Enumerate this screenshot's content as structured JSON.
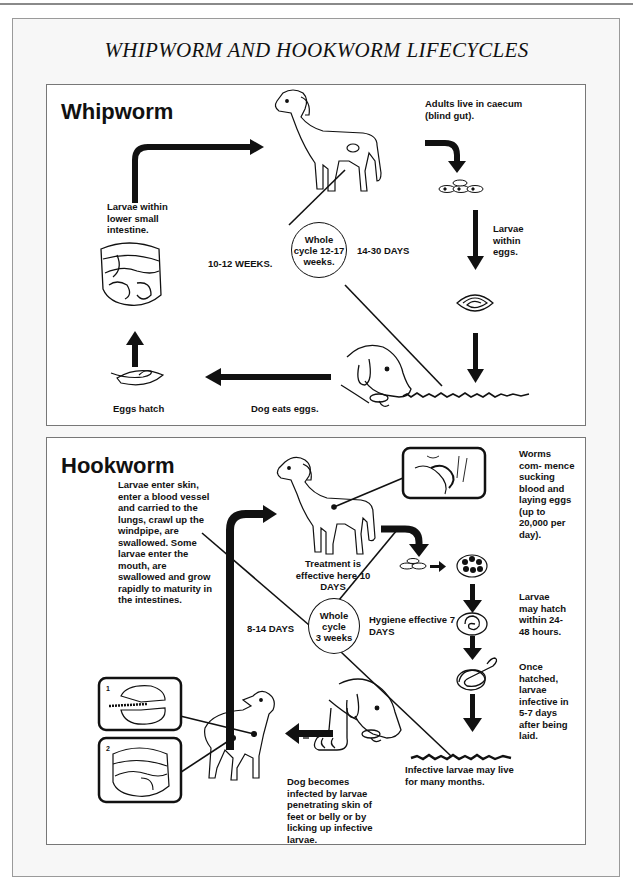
{
  "title": "WHIPWORM AND HOOKWORM LIFECYCLES",
  "whipworm": {
    "heading": "Whipworm",
    "cycle_circle": "Whole\ncycle 12-17\nweeks.",
    "left_duration": "10-12 WEEKS.",
    "right_duration": "14-30 DAYS",
    "stages": [
      {
        "id": "adults",
        "label": "Adults live in caecum (blind gut)."
      },
      {
        "id": "larvae-in-eggs",
        "label": "Larvae within eggs."
      },
      {
        "id": "dog-eats-eggs",
        "label": "Dog eats eggs."
      },
      {
        "id": "eggs-hatch",
        "label": "Eggs hatch"
      },
      {
        "id": "larvae-intestine",
        "label": "Larvae within lower small intestine."
      }
    ]
  },
  "hookworm": {
    "heading": "Hookworm",
    "cycle_circle": "Whole\ncycle\n3 weeks",
    "left_duration": "8-14 DAYS",
    "treatment_note": "Treatment is effective here 10 DAYS",
    "hygiene_note": "Hygiene effective 7 DAYS",
    "stages": [
      {
        "id": "worms-feed",
        "label": "Worms com- mence sucking blood and laying eggs (up to 20,000 per day)."
      },
      {
        "id": "larvae-hatch",
        "label": "Larvae may hatch within 24-48 hours."
      },
      {
        "id": "larvae-infective",
        "label": "Once hatched, larvae infective in 5-7 days after being laid."
      },
      {
        "id": "infective-larvae-live",
        "label": "Infective larvae may live for many months."
      },
      {
        "id": "dog-infected",
        "label": "Dog becomes infected by larvae penetrating skin of feet or belly or by licking up infective larvae."
      },
      {
        "id": "larvae-migration",
        "label": "Larvae enter skin, enter a blood vessel and carried to the lungs, crawl up the windpipe, are swallowed. Some larvae enter the mouth, are swallowed and grow rapidly to maturity in the intestines."
      }
    ],
    "inset_labels": [
      "1",
      "2"
    ]
  }
}
